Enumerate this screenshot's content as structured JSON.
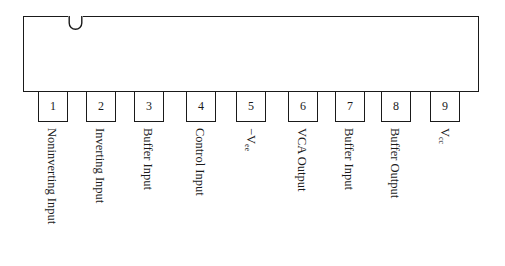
{
  "diagram": {
    "type": "ic-pinout",
    "package": "9-pin single in-line package",
    "pins": [
      {
        "number": "1",
        "label": "Noninverting Input",
        "x": 38
      },
      {
        "number": "2",
        "label": "Inverting Input",
        "x": 86
      },
      {
        "number": "3",
        "label": "Buffer Input",
        "x": 134
      },
      {
        "number": "4",
        "label": "Control Input",
        "x": 186
      },
      {
        "number": "5",
        "label_main": "−V",
        "label_sub": "ee",
        "x": 236
      },
      {
        "number": "6",
        "label": "VCA Output",
        "x": 288
      },
      {
        "number": "7",
        "label": "Buffer Input",
        "x": 335
      },
      {
        "number": "8",
        "label": "Buffer Output",
        "x": 381
      },
      {
        "number": "9",
        "label_main": "V",
        "label_sub": "cc",
        "x": 430
      }
    ]
  }
}
